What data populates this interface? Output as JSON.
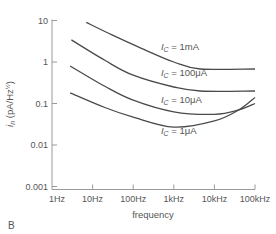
{
  "chart_data": {
    "type": "line",
    "title": "",
    "panel_label": "B",
    "xlabel": "frequency",
    "ylabel": "i_n (pA/Hz^½)",
    "ylabel_parts": {
      "symbol": "i",
      "sub": "n",
      "units": "(pA/Hz",
      "sup": "½",
      "close": ")"
    },
    "xscale": "log",
    "yscale": "log",
    "xlim": [
      1,
      100000
    ],
    "ylim": [
      0.001,
      10
    ],
    "x_ticks": [
      1,
      10,
      100,
      1000,
      10000,
      100000
    ],
    "x_tick_labels": [
      "1Hz",
      "10Hz",
      "100Hz",
      "1kHz",
      "10kHz",
      "100kHz"
    ],
    "y_ticks": [
      10,
      1,
      0.1,
      0.01,
      0.001
    ],
    "y_tick_labels": [
      "10",
      "1",
      "0.1",
      "0.01",
      "0.001"
    ],
    "grid": false,
    "legend": "inline curve labels",
    "series": [
      {
        "name": "I_C = 1mA",
        "label_sym": "I",
        "label_sub": "C",
        "label_val": " = 1mA",
        "x": [
          7,
          30,
          150,
          1000,
          4500,
          100000
        ],
        "y": [
          9,
          4.5,
          2.2,
          1.0,
          0.68,
          0.68
        ]
      },
      {
        "name": "I_C = 100μA",
        "label_sym": "I",
        "label_sub": "C",
        "label_val": " = 100μA",
        "x": [
          3,
          20,
          100,
          1000,
          4500,
          100000
        ],
        "y": [
          3.4,
          1.1,
          0.48,
          0.25,
          0.2,
          0.2
        ]
      },
      {
        "name": "I_C = 10μA",
        "label_sym": "I",
        "label_sub": "C",
        "label_val": " = 10μA",
        "x": [
          2.8,
          20,
          100,
          1000,
          10000,
          40000,
          100000
        ],
        "y": [
          0.8,
          0.26,
          0.12,
          0.063,
          0.055,
          0.07,
          0.1
        ]
      },
      {
        "name": "I_C = 1μA",
        "label_sym": "I",
        "label_sub": "C",
        "label_val": " = 1μA",
        "x": [
          2.8,
          20,
          100,
          1000,
          10000,
          40000,
          100000
        ],
        "y": [
          0.18,
          0.08,
          0.047,
          0.027,
          0.038,
          0.07,
          0.14
        ]
      }
    ],
    "label_positions": [
      {
        "x": 1500,
        "y": 1.9
      },
      {
        "x": 1500,
        "y": 0.45
      },
      {
        "x": 1500,
        "y": 0.105
      },
      {
        "x": 1500,
        "y": 0.018
      }
    ]
  },
  "style": {
    "line_color": "#4a4a4a",
    "axis_color": "#9a9a9a"
  }
}
